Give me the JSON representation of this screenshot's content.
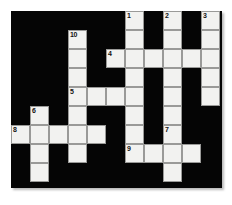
{
  "puzzle": {
    "kind": "crossword-grid",
    "title": "Crossword puzzle grid",
    "grid": {
      "columns": 11,
      "rows": 9,
      "cell_size": 19,
      "origin_x": 11,
      "origin_y": 11,
      "fill_color": "#f2f2f0",
      "block_color": "#050505",
      "border_color": "#9a9a98",
      "number_color": "#111111"
    },
    "clue_numbers": [
      "1",
      "2",
      "3",
      "4",
      "5",
      "6",
      "7",
      "8",
      "9",
      "10"
    ],
    "entries": [
      {
        "number": "1",
        "direction": "down",
        "col": 6,
        "row": 0,
        "length": 8
      },
      {
        "number": "2",
        "direction": "down",
        "col": 8,
        "row": 0,
        "length": 5
      },
      {
        "number": "3",
        "direction": "down",
        "col": 10,
        "row": 0,
        "length": 5
      },
      {
        "number": "4",
        "direction": "across",
        "col": 5,
        "row": 2,
        "length": 6
      },
      {
        "number": "5",
        "direction": "across",
        "col": 3,
        "row": 4,
        "length": 4
      },
      {
        "number": "6",
        "direction": "down",
        "col": 1,
        "row": 5,
        "length": 4
      },
      {
        "number": "7",
        "direction": "down",
        "col": 8,
        "row": 6,
        "length": 4
      },
      {
        "number": "8",
        "direction": "across",
        "col": 0,
        "row": 6,
        "length": 5
      },
      {
        "number": "9",
        "direction": "across",
        "col": 6,
        "row": 7,
        "length": 4
      },
      {
        "number": "10",
        "direction": "down",
        "col": 3,
        "row": 1,
        "length": 7
      }
    ],
    "cells": [
      {
        "col": 6,
        "row": 0,
        "number": "1"
      },
      {
        "col": 8,
        "row": 0,
        "number": "2"
      },
      {
        "col": 10,
        "row": 0,
        "number": "3"
      },
      {
        "col": 3,
        "row": 1,
        "number": "10"
      },
      {
        "col": 6,
        "row": 1,
        "number": null
      },
      {
        "col": 8,
        "row": 1,
        "number": null
      },
      {
        "col": 10,
        "row": 1,
        "number": null
      },
      {
        "col": 3,
        "row": 2,
        "number": null
      },
      {
        "col": 5,
        "row": 2,
        "number": "4"
      },
      {
        "col": 6,
        "row": 2,
        "number": null
      },
      {
        "col": 7,
        "row": 2,
        "number": null
      },
      {
        "col": 8,
        "row": 2,
        "number": null
      },
      {
        "col": 9,
        "row": 2,
        "number": null
      },
      {
        "col": 10,
        "row": 2,
        "number": null
      },
      {
        "col": 3,
        "row": 3,
        "number": null
      },
      {
        "col": 6,
        "row": 3,
        "number": null
      },
      {
        "col": 8,
        "row": 3,
        "number": null
      },
      {
        "col": 10,
        "row": 3,
        "number": null
      },
      {
        "col": 3,
        "row": 4,
        "number": "5"
      },
      {
        "col": 4,
        "row": 4,
        "number": null
      },
      {
        "col": 5,
        "row": 4,
        "number": null
      },
      {
        "col": 6,
        "row": 4,
        "number": null
      },
      {
        "col": 8,
        "row": 4,
        "number": null
      },
      {
        "col": 10,
        "row": 4,
        "number": null
      },
      {
        "col": 3,
        "row": 5,
        "number": null
      },
      {
        "col": 6,
        "row": 5,
        "number": null
      },
      {
        "col": 8,
        "row": 5,
        "number": null
      },
      {
        "col": 1,
        "row": 5,
        "number": "6"
      },
      {
        "col": 3,
        "row": 6,
        "number": null
      },
      {
        "col": 6,
        "row": 6,
        "number": null
      },
      {
        "col": 8,
        "row": 6,
        "number": "7"
      },
      {
        "col": 0,
        "row": 6,
        "number": "8"
      },
      {
        "col": 1,
        "row": 6,
        "number": null
      },
      {
        "col": 2,
        "row": 6,
        "number": null
      },
      {
        "col": 3,
        "row": 6,
        "number": null
      },
      {
        "col": 4,
        "row": 6,
        "number": null
      },
      {
        "col": 1,
        "row": 7,
        "number": null
      },
      {
        "col": 3,
        "row": 7,
        "number": null
      },
      {
        "col": 6,
        "row": 7,
        "number": "9"
      },
      {
        "col": 7,
        "row": 7,
        "number": null
      },
      {
        "col": 8,
        "row": 7,
        "number": null
      },
      {
        "col": 9,
        "row": 7,
        "number": null
      },
      {
        "col": 1,
        "row": 8,
        "number": null
      },
      {
        "col": 8,
        "row": 8,
        "number": null
      }
    ]
  }
}
